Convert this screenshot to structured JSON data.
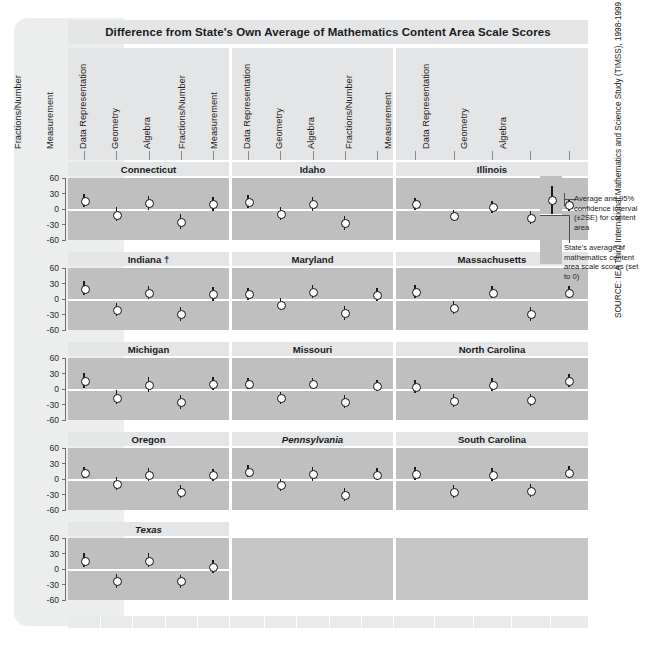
{
  "title": "Difference from State's Own Average of Mathematics Content Area Scale Scores",
  "source": "SOURCE: IEA Third International Mathematics and Science Study (TIMSS), 1998-1999",
  "legend": {
    "interval_label": "Average and 95% confidence interval (±2SE) for content area",
    "zero_label": "State's average of mathematics content area scale scores (set to 0)"
  },
  "axis": {
    "ylabel": "",
    "yticks": [
      "60",
      "30",
      "0",
      "-30",
      "-60"
    ],
    "ylim": [
      -60,
      60
    ]
  },
  "content_areas": [
    "Fractions/Number",
    "Measurement",
    "Data Representation",
    "Geometry",
    "Algebra"
  ],
  "chart_data": {
    "type": "scatter",
    "title": "Difference from State's Own Average of Mathematics Content Area Scale Scores",
    "xlabel": "",
    "ylabel": "Difference from state average",
    "ylim": [
      -60,
      60
    ],
    "yticks": [
      60,
      30,
      0,
      -30,
      -60
    ],
    "grid": false,
    "legend_position": "right",
    "categories": [
      "Fractions/Number",
      "Measurement",
      "Data Representation",
      "Geometry",
      "Algebra"
    ],
    "error_type": "95% confidence interval (±2SE)",
    "panels": [
      {
        "state": "Connecticut",
        "italic": false,
        "dagger": false,
        "values": [
          17,
          -10,
          12,
          -24,
          10
        ],
        "lo": [
          4,
          -24,
          -2,
          -38,
          -4
        ],
        "hi": [
          30,
          3,
          26,
          -10,
          24
        ]
      },
      {
        "state": "Idaho",
        "italic": false,
        "dagger": false,
        "values": [
          14,
          -9,
          10,
          -27,
          null
        ],
        "lo": [
          1,
          -22,
          -3,
          -40,
          null
        ],
        "hi": [
          27,
          3,
          24,
          -14,
          null
        ]
      },
      {
        "state": "Illinois",
        "italic": false,
        "dagger": false,
        "values": [
          10,
          -12,
          4,
          -16,
          8
        ],
        "lo": [
          -2,
          -24,
          -7,
          -30,
          -3
        ],
        "hi": [
          22,
          -1,
          16,
          -3,
          19
        ]
      },
      {
        "state": "Indiana",
        "italic": false,
        "dagger": true,
        "values": [
          21,
          -20,
          13,
          -29,
          10
        ],
        "lo": [
          8,
          -33,
          0,
          -43,
          -3
        ],
        "hi": [
          35,
          -7,
          26,
          -16,
          24
        ]
      },
      {
        "state": "Maryland",
        "italic": false,
        "dagger": false,
        "values": [
          10,
          -10,
          14,
          -27,
          8
        ],
        "lo": [
          -2,
          -22,
          1,
          -41,
          -4
        ],
        "hi": [
          22,
          1,
          28,
          -14,
          21
        ]
      },
      {
        "state": "Massachusetts",
        "italic": false,
        "dagger": false,
        "values": [
          14,
          -16,
          13,
          -28,
          13
        ],
        "lo": [
          2,
          -29,
          1,
          -42,
          2
        ],
        "hi": [
          27,
          -3,
          26,
          -15,
          25
        ]
      },
      {
        "state": "Michigan",
        "italic": false,
        "dagger": false,
        "values": [
          16,
          -16,
          8,
          -25,
          10
        ],
        "lo": [
          2,
          -29,
          -6,
          -39,
          -2
        ],
        "hi": [
          31,
          -2,
          23,
          -11,
          23
        ]
      },
      {
        "state": "Missouri",
        "italic": false,
        "dagger": false,
        "values": [
          10,
          -17,
          11,
          -24,
          7
        ],
        "lo": [
          0,
          -29,
          1,
          -36,
          -3
        ],
        "hi": [
          21,
          -5,
          22,
          -12,
          18
        ]
      },
      {
        "state": "North Carolina",
        "italic": false,
        "dagger": false,
        "values": [
          5,
          -22,
          9,
          -21,
          17
        ],
        "lo": [
          -7,
          -34,
          -3,
          -32,
          4
        ],
        "hi": [
          17,
          -10,
          22,
          -10,
          30
        ]
      },
      {
        "state": "Oregon",
        "italic": false,
        "dagger": false,
        "values": [
          12,
          -8,
          8,
          -24,
          8
        ],
        "lo": [
          1,
          -21,
          -4,
          -37,
          -3
        ],
        "hi": [
          24,
          4,
          22,
          -12,
          20
        ]
      },
      {
        "state": "Pennsylvania",
        "italic": true,
        "dagger": false,
        "values": [
          15,
          -11,
          10,
          -30,
          9
        ],
        "lo": [
          4,
          -23,
          -4,
          -42,
          -2
        ],
        "hi": [
          27,
          0,
          24,
          -18,
          21
        ]
      },
      {
        "state": "South Carolina",
        "italic": false,
        "dagger": false,
        "values": [
          11,
          -24,
          9,
          -22,
          13
        ],
        "lo": [
          -1,
          -36,
          -4,
          -34,
          1
        ],
        "hi": [
          23,
          -11,
          22,
          -10,
          26
        ]
      },
      {
        "state": "Texas",
        "italic": true,
        "dagger": false,
        "values": [
          17,
          -22,
          17,
          -23,
          5
        ],
        "lo": [
          3,
          -36,
          3,
          -36,
          -8
        ],
        "hi": [
          31,
          -9,
          31,
          -11,
          18
        ]
      }
    ]
  }
}
